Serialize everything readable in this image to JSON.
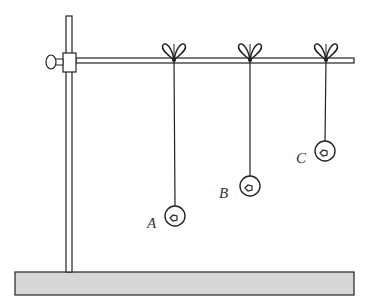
{
  "diagram": {
    "colors": {
      "line": "#222222",
      "rod_fill": "#ffffff",
      "base_fill": "#d6d6d6",
      "background": "#ffffff"
    },
    "stand": {
      "pole": {
        "x": 66,
        "y_top": 16,
        "y_bottom": 272,
        "width": 6
      },
      "clamp": {
        "x": 63,
        "y": 53,
        "w": 13,
        "h": 19
      },
      "knob": {
        "cx": 51,
        "cy": 62,
        "rx": 5,
        "ry": 7
      },
      "rod": {
        "x1": 76,
        "x2": 354,
        "y": 58,
        "h": 5
      },
      "base": {
        "x": 15,
        "y": 272,
        "w": 339,
        "h": 23
      }
    },
    "pendulums": [
      {
        "label": "A",
        "knot_x": 174,
        "string_top": 60,
        "bob_cx": 175,
        "bob_cy": 216,
        "bob_r": 10,
        "label_x": 147,
        "label_y": 228
      },
      {
        "label": "B",
        "knot_x": 250,
        "string_top": 60,
        "bob_cx": 250,
        "bob_cy": 186,
        "bob_r": 10,
        "label_x": 219,
        "label_y": 198
      },
      {
        "label": "C",
        "knot_x": 326,
        "string_top": 60,
        "bob_cx": 325,
        "bob_cy": 151,
        "bob_r": 10,
        "label_x": 296,
        "label_y": 163
      }
    ]
  }
}
